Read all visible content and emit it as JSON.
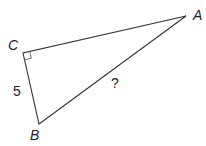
{
  "diagram": {
    "type": "right-triangle",
    "vertices": [
      {
        "label": "A",
        "x": 186,
        "y": 16,
        "label_x": 193,
        "label_y": 20
      },
      {
        "label": "B",
        "x": 39,
        "y": 124,
        "label_x": 30,
        "label_y": 140
      },
      {
        "label": "C",
        "x": 23,
        "y": 53,
        "label_x": 8,
        "label_y": 50
      }
    ],
    "right_angle_at": "C",
    "sides": [
      {
        "name": "CB",
        "label": "5",
        "label_x": 13,
        "label_y": 96
      },
      {
        "name": "AB",
        "label": "?",
        "label_x": 111,
        "label_y": 88
      },
      {
        "name": "CA",
        "label": ""
      }
    ],
    "stroke_color": "#333333",
    "text_color": "#222222"
  }
}
